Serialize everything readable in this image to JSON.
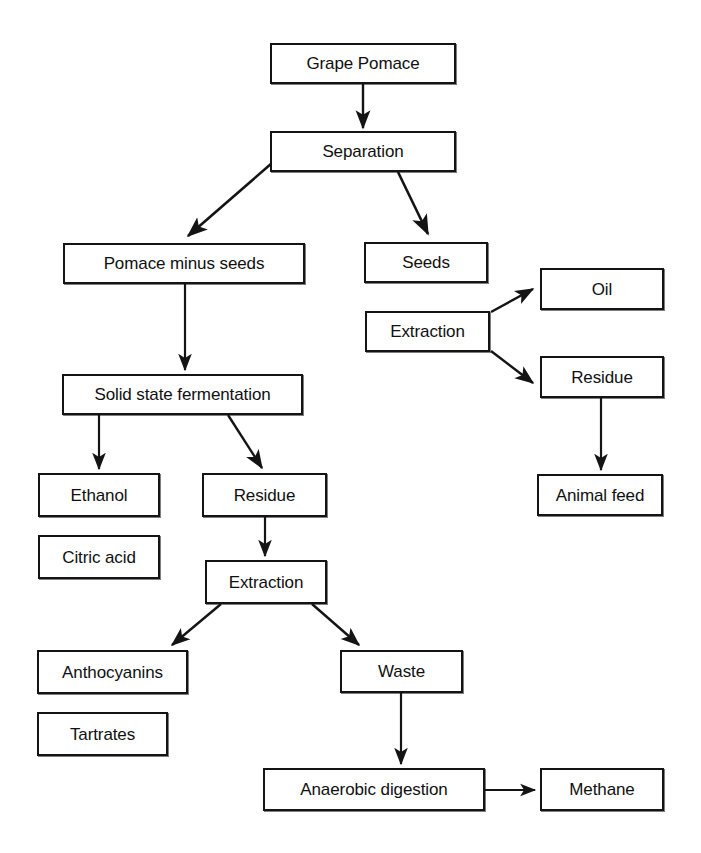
{
  "diagram": {
    "background_color": "#ffffff",
    "line_color": "#141414",
    "text_color": "#101010",
    "nodes": [
      {
        "id": "grape-pomace",
        "label": "Grape Pomace",
        "x": 270,
        "y": 43,
        "w": 186,
        "h": 41
      },
      {
        "id": "separation",
        "label": "Separation",
        "x": 270,
        "y": 131,
        "w": 186,
        "h": 41
      },
      {
        "id": "pomace-minus-seeds",
        "label": "Pomace minus seeds",
        "x": 63,
        "y": 243,
        "w": 242,
        "h": 41
      },
      {
        "id": "seeds",
        "label": "Seeds",
        "x": 364,
        "y": 242,
        "w": 124,
        "h": 41
      },
      {
        "id": "extraction-seeds",
        "label": "Extraction",
        "x": 365,
        "y": 311,
        "w": 125,
        "h": 41
      },
      {
        "id": "oil",
        "label": "Oil",
        "x": 540,
        "y": 268,
        "w": 124,
        "h": 42
      },
      {
        "id": "residue-seeds",
        "label": "Residue",
        "x": 540,
        "y": 356,
        "w": 124,
        "h": 42
      },
      {
        "id": "animal-feed",
        "label": "Animal feed",
        "x": 537,
        "y": 474,
        "w": 126,
        "h": 42
      },
      {
        "id": "solid-state-fermentation",
        "label": "Solid state fermentation",
        "x": 62,
        "y": 374,
        "w": 241,
        "h": 41
      },
      {
        "id": "ethanol",
        "label": "Ethanol",
        "x": 38,
        "y": 473,
        "w": 122,
        "h": 44
      },
      {
        "id": "citric-acid",
        "label": "Citric acid",
        "x": 38,
        "y": 535,
        "w": 122,
        "h": 44
      },
      {
        "id": "residue-pomace",
        "label": "Residue",
        "x": 202,
        "y": 473,
        "w": 125,
        "h": 44
      },
      {
        "id": "extraction-pomace",
        "label": "Extraction",
        "x": 205,
        "y": 560,
        "w": 122,
        "h": 44
      },
      {
        "id": "anthocyanins",
        "label": "Anthocyanins",
        "x": 37,
        "y": 650,
        "w": 151,
        "h": 44
      },
      {
        "id": "tartrates",
        "label": "Tartrates",
        "x": 37,
        "y": 712,
        "w": 131,
        "h": 44
      },
      {
        "id": "waste",
        "label": "Waste",
        "x": 340,
        "y": 650,
        "w": 123,
        "h": 43
      },
      {
        "id": "anaerobic-digestion",
        "label": "Anaerobic digestion",
        "x": 263,
        "y": 768,
        "w": 222,
        "h": 43
      },
      {
        "id": "methane",
        "label": "Methane",
        "x": 540,
        "y": 768,
        "w": 124,
        "h": 43
      }
    ],
    "edges": [
      {
        "id": "grape-pomace-to-separation",
        "from": "grape-pomace",
        "to": "separation",
        "kind": "vertical"
      },
      {
        "id": "separation-to-pomace-minus-seeds",
        "from": "separation",
        "to": "pomace-minus-seeds",
        "kind": "diagonal-left"
      },
      {
        "id": "separation-to-seeds",
        "from": "separation",
        "to": "seeds",
        "kind": "diagonal-right"
      },
      {
        "id": "extraction-to-oil",
        "from": "extraction-seeds",
        "to": "oil",
        "kind": "diagonal-right-up"
      },
      {
        "id": "extraction-to-residue",
        "from": "extraction-seeds",
        "to": "residue-seeds",
        "kind": "diagonal-right-down"
      },
      {
        "id": "residue-to-animal-feed",
        "from": "residue-seeds",
        "to": "animal-feed",
        "kind": "vertical"
      },
      {
        "id": "pomace-to-solid-state-fermentation",
        "from": "pomace-minus-seeds",
        "to": "solid-state-fermentation",
        "kind": "vertical"
      },
      {
        "id": "fermentation-to-ethanol",
        "from": "solid-state-fermentation",
        "to": "ethanol",
        "kind": "vertical"
      },
      {
        "id": "fermentation-to-residue",
        "from": "solid-state-fermentation",
        "to": "residue-pomace",
        "kind": "diagonal-right-down"
      },
      {
        "id": "residue-to-extraction",
        "from": "residue-pomace",
        "to": "extraction-pomace",
        "kind": "vertical"
      },
      {
        "id": "extraction-to-anthocyanins",
        "from": "extraction-pomace",
        "to": "anthocyanins",
        "kind": "diagonal-left-down"
      },
      {
        "id": "extraction-to-waste",
        "from": "extraction-pomace",
        "to": "waste",
        "kind": "diagonal-right-down"
      },
      {
        "id": "waste-to-anaerobic-digestion",
        "from": "waste",
        "to": "anaerobic-digestion",
        "kind": "vertical"
      },
      {
        "id": "anaerobic-digestion-to-methane",
        "from": "anaerobic-digestion",
        "to": "methane",
        "kind": "horizontal"
      }
    ]
  }
}
